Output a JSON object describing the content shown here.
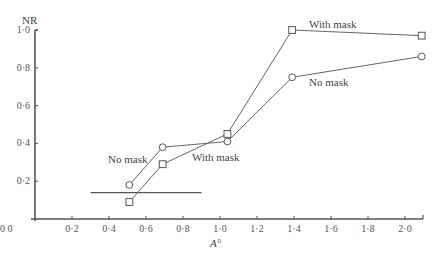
{
  "chart_data": {
    "type": "line",
    "title": "",
    "xlabel": "A°",
    "ylabel": "NR",
    "xlim": [
      0.0,
      2.1
    ],
    "ylim": [
      0.0,
      1.0
    ],
    "x_ticks": [
      "0·2",
      "0·4",
      "0·6",
      "0·8",
      "1·0",
      "1·2",
      "1·4",
      "1·6",
      "1·8",
      "2·0"
    ],
    "y_ticks": [
      "0·2",
      "0·4",
      "0·6",
      "0·8",
      "1·0"
    ],
    "origin_label": "0 0",
    "grid": false,
    "legend": "inline labels",
    "series": [
      {
        "name": "No mask",
        "marker": "circle",
        "x": [
          0.51,
          0.69,
          1.04,
          1.39,
          2.09
        ],
        "values": [
          0.18,
          0.38,
          0.41,
          0.75,
          0.86
        ]
      },
      {
        "name": "With mask",
        "marker": "square",
        "x": [
          0.51,
          0.69,
          1.04,
          1.39,
          2.09
        ],
        "values": [
          0.09,
          0.29,
          0.45,
          1.0,
          0.97
        ]
      }
    ],
    "reference_line": {
      "y": 0.14,
      "x_start": 0.3,
      "x_end": 0.9
    },
    "annotations": [
      {
        "text": "No mask",
        "near": "series 1, x≈0.5"
      },
      {
        "text": "With mask",
        "near": "series 2, x≈0.85"
      },
      {
        "text": "With mask",
        "near": "series 2, x≈1.6"
      },
      {
        "text": "No mask",
        "near": "series 1, x≈1.6"
      }
    ]
  },
  "labels": {
    "ylabel": "NR",
    "xlabel": "A°",
    "origin": "0 0",
    "no_mask_left": "No mask",
    "with_mask_left": "With mask",
    "with_mask_right": "With mask",
    "no_mask_right": "No mask"
  }
}
